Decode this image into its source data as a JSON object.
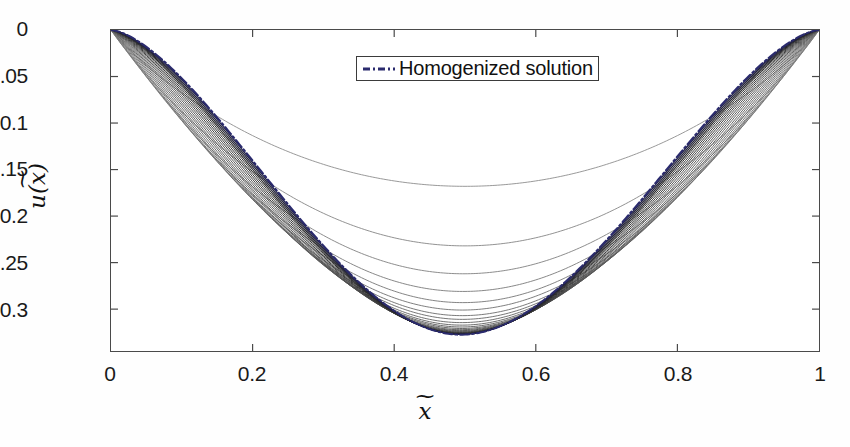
{
  "figure": {
    "background": "#ffffff",
    "axis_color": "#4a4a4a"
  },
  "legend": {
    "entries": [
      {
        "label": "Homogenized solution",
        "color": "#2b2b6e",
        "style": "dash-dot"
      }
    ]
  },
  "axis_titles": {
    "x": {
      "base": "x",
      "accent": "~"
    },
    "y": {
      "prefix": "u(",
      "base": "x",
      "accent": "~",
      "suffix": ")"
    }
  },
  "chart_data": {
    "type": "line",
    "title": "",
    "subtitle": "",
    "xlabel": "x̃",
    "ylabel": "u(x̃)",
    "xlim": [
      0,
      1
    ],
    "ylim": [
      -0.345,
      0
    ],
    "grid": false,
    "legend_position": "top-center",
    "xticks": [
      0,
      0.2,
      0.4,
      0.6,
      0.8,
      1
    ],
    "xticklabels": [
      "0",
      "0.2",
      "0.4",
      "0.6",
      "0.8",
      "1"
    ],
    "yticks": [
      0,
      -0.05,
      -0.1,
      -0.15,
      -0.2,
      -0.25,
      -0.3
    ],
    "yticklabels": [
      "0",
      "-0.05",
      "-0.1",
      "-0.15",
      "-0.2",
      "-0.25",
      "-0.3"
    ],
    "x": [
      0,
      0.02,
      0.04,
      0.06,
      0.08,
      0.1,
      0.12,
      0.14,
      0.16,
      0.18,
      0.2,
      0.22,
      0.24,
      0.26,
      0.28,
      0.3,
      0.32,
      0.34,
      0.36,
      0.38,
      0.4,
      0.42,
      0.44,
      0.46,
      0.48,
      0.5,
      0.52,
      0.54,
      0.56,
      0.58,
      0.6,
      0.62,
      0.64,
      0.66,
      0.68,
      0.7,
      0.72,
      0.74,
      0.76,
      0.78,
      0.8,
      0.82,
      0.84,
      0.86,
      0.88,
      0.9,
      0.92,
      0.94,
      0.96,
      0.98,
      1
    ],
    "series_note": "Family of oscillatory-coefficient solutions u_eps(x) for decreasing eps, converging from above to the homogenized solution. Each series is a downward parabola-like curve with u(0)=u(1)=0; depth_min is the curve minimum value, located slightly left of x=0.5.",
    "series": [
      {
        "name": "eps level 1",
        "depth_min": -0.168,
        "min_x": 0.5,
        "skew": 0.0,
        "color": "#8d8d8d",
        "width": 0.9
      },
      {
        "name": "eps level 2",
        "depth_min": -0.232,
        "min_x": 0.5,
        "skew": 0.0,
        "color": "#858585",
        "width": 0.9
      },
      {
        "name": "eps level 3",
        "depth_min": -0.262,
        "min_x": 0.498,
        "skew": 0.0,
        "color": "#7f7f7f",
        "width": 0.9
      },
      {
        "name": "eps level 4",
        "depth_min": -0.281,
        "min_x": 0.497,
        "skew": 0.0,
        "color": "#7a7a7a",
        "width": 0.9
      },
      {
        "name": "eps level 5",
        "depth_min": -0.293,
        "min_x": 0.497,
        "skew": 0.0,
        "color": "#757575",
        "width": 0.9
      },
      {
        "name": "eps level 6",
        "depth_min": -0.301,
        "min_x": 0.496,
        "skew": 0.0,
        "color": "#707070",
        "width": 0.9
      },
      {
        "name": "eps level 7",
        "depth_min": -0.307,
        "min_x": 0.496,
        "skew": 0.0,
        "color": "#6b6b6b",
        "width": 0.9
      },
      {
        "name": "eps level 8",
        "depth_min": -0.311,
        "min_x": 0.496,
        "skew": 0.0,
        "color": "#666666",
        "width": 0.9
      },
      {
        "name": "eps level 9",
        "depth_min": -0.3145,
        "min_x": 0.495,
        "skew": 0.0,
        "color": "#616161",
        "width": 0.9
      },
      {
        "name": "eps level 10",
        "depth_min": -0.3172,
        "min_x": 0.495,
        "skew": 0.0,
        "color": "#5c5c5c",
        "width": 0.9
      },
      {
        "name": "eps level 11",
        "depth_min": -0.3192,
        "min_x": 0.495,
        "skew": 0.0,
        "color": "#585858",
        "width": 0.9
      },
      {
        "name": "eps level 12",
        "depth_min": -0.3208,
        "min_x": 0.495,
        "skew": 0.0,
        "color": "#545454",
        "width": 0.9
      },
      {
        "name": "eps level 13",
        "depth_min": -0.3221,
        "min_x": 0.494,
        "skew": 0.0,
        "color": "#505050",
        "width": 0.9
      },
      {
        "name": "eps level 14",
        "depth_min": -0.3231,
        "min_x": 0.494,
        "skew": 0.0,
        "color": "#4c4c4c",
        "width": 0.9
      },
      {
        "name": "eps level 15",
        "depth_min": -0.3239,
        "min_x": 0.494,
        "skew": 0.0,
        "color": "#484848",
        "width": 0.9
      },
      {
        "name": "eps level 16",
        "depth_min": -0.3246,
        "min_x": 0.494,
        "skew": 0.0,
        "color": "#444444",
        "width": 0.9
      },
      {
        "name": "eps level 17",
        "depth_min": -0.3251,
        "min_x": 0.494,
        "skew": 0.0,
        "color": "#3f3f3f",
        "width": 1.0
      },
      {
        "name": "eps level 18",
        "depth_min": -0.3256,
        "min_x": 0.494,
        "skew": 0.0,
        "color": "#3a3a3a",
        "width": 1.0
      },
      {
        "name": "eps level 19",
        "depth_min": -0.326,
        "min_x": 0.494,
        "skew": 0.0,
        "color": "#353535",
        "width": 1.0
      },
      {
        "name": "eps level 20",
        "depth_min": -0.3263,
        "min_x": 0.494,
        "skew": 0.0,
        "color": "#303030",
        "width": 1.0
      },
      {
        "name": "eps level 21",
        "depth_min": -0.3266,
        "min_x": 0.494,
        "skew": 0.0,
        "color": "#2a2a2a",
        "width": 1.1
      },
      {
        "name": "eps level 22",
        "depth_min": -0.3268,
        "min_x": 0.494,
        "skew": 0.0,
        "color": "#252530",
        "width": 1.1
      },
      {
        "name": "eps level 23",
        "depth_min": -0.327,
        "min_x": 0.494,
        "skew": 0.0,
        "color": "#222238",
        "width": 1.2
      },
      {
        "name": "eps level 24",
        "depth_min": -0.3272,
        "min_x": 0.494,
        "skew": 0.0,
        "color": "#202045",
        "width": 1.3
      }
    ],
    "homogenized": {
      "name": "Homogenized solution",
      "depth_min": -0.3275,
      "min_x": 0.494,
      "color": "#2b2b6e",
      "width": 2.0,
      "dash": "dash-dot"
    }
  }
}
